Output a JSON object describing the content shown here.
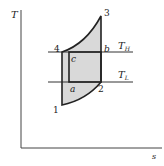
{
  "diagram": {
    "type": "T-s diagram",
    "axes": {
      "y_label": "T",
      "x_label": "s"
    },
    "isotherms": {
      "high": "T",
      "high_sub": "H",
      "low": "T",
      "low_sub": "L"
    },
    "points": {
      "p1": "1",
      "p2": "2",
      "p3": "3",
      "p4": "4",
      "a": "a",
      "b": "b",
      "c": "c"
    },
    "colors": {
      "fill": "#d9d9d9",
      "line": "#333333"
    }
  }
}
